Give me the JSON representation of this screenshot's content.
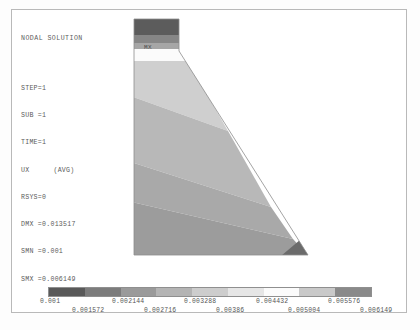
{
  "window": {
    "title": "NODAL SOLUTION",
    "width": 420,
    "height": 330,
    "background": "#ffffff",
    "border_color": "#b9b9b9"
  },
  "header": {
    "title": "NODAL SOLUTION",
    "lines": [
      "STEP=1",
      "SUB =1",
      "TIME=1"
    ],
    "result_label": "UX",
    "result_qualifier": "(AVG)",
    "rsys": "RSYS=0",
    "dmx": "DMX =0.013517",
    "smn": "SMN =0.001",
    "smx": "SMX =0.006149"
  },
  "annotations": {
    "max_marker": "MX",
    "min_marker": "MN",
    "axis_label": "X"
  },
  "chart_data": {
    "type": "heatmap",
    "title": "NODAL SOLUTION",
    "subtitle": "UX (AVG)",
    "xlabel": "",
    "ylabel": "",
    "colormap": "grayscale-banded",
    "min_value": 0.001,
    "max_value": 0.006149,
    "band_count": 9,
    "legend_position": "bottom",
    "legend_ticks_upper": [
      "0.001",
      "0.002144",
      "0.003288",
      "0.004432",
      "0.005576"
    ],
    "legend_ticks_lower": [
      "0.001572",
      "0.002716",
      "0.00386",
      "0.005004",
      "0.006149"
    ],
    "band_boundaries": [
      0.001,
      0.001572,
      0.002144,
      0.002716,
      0.003288,
      0.00386,
      0.004432,
      0.005004,
      0.005576,
      0.006149
    ],
    "band_colors": [
      "#595959",
      "#7c7c7c",
      "#9a9a9a",
      "#b4b4b4",
      "#cdcdcd",
      "#e6e6e6",
      "#fbfbfb",
      "#c9c9c9",
      "#8a8a8a"
    ],
    "contour_bands": [
      {
        "index": 0,
        "range": [
          0.001,
          0.001572
        ],
        "color": "#595959",
        "location": "top of stem (MX region)"
      },
      {
        "index": 1,
        "range": [
          0.001572,
          0.002144
        ],
        "color": "#7c7c7c",
        "location": "upper stem"
      },
      {
        "index": 2,
        "range": [
          0.002144,
          0.002716
        ],
        "color": "#9a9a9a",
        "location": "stem mid"
      },
      {
        "index": 3,
        "range": [
          0.002716,
          0.003288
        ],
        "color": "#fbfbfb",
        "location": "stem light band"
      },
      {
        "index": 4,
        "range": [
          0.003288,
          0.00386
        ],
        "color": "#cdcdcd",
        "location": "upper taper"
      },
      {
        "index": 5,
        "range": [
          0.00386,
          0.004432
        ],
        "color": "#b4b4b4",
        "location": "mid body"
      },
      {
        "index": 6,
        "range": [
          0.004432,
          0.005004
        ],
        "color": "#a8a8a8",
        "location": "lower body"
      },
      {
        "index": 7,
        "range": [
          0.005004,
          0.005576
        ],
        "color": "#9a9a9a",
        "location": "base"
      },
      {
        "index": 8,
        "range": [
          0.005576,
          0.006149
        ],
        "color": "#6a6a6a",
        "location": "bottom right corner (MN region)"
      }
    ],
    "geometry": {
      "shape": "tapered cantilever wall with narrow vertical stem widening to triangular base",
      "max_location": "top of stem",
      "min_location": "bottom right corner"
    }
  }
}
